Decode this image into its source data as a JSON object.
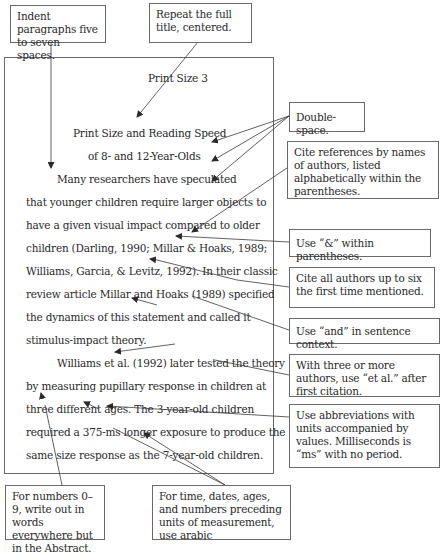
{
  "manuscript": {
    "running_head": "Print Size  3",
    "title_line1": "Print Size and Reading Speed",
    "title_line2": "of 8- and 12-Year-Olds",
    "lines": [
      "Many researchers have speculated",
      "that younger children require larger objects to",
      "have a given visual impact compared to older",
      "children (Darling, 1990;  Millar & Hoaks, 1989;",
      "Williams, Garcia, & Levitz, 1992).  In their classic",
      "review article Millar and Hoaks (1989) specified",
      "the dynamics of this statement and called it",
      "stimulus-impact theory.",
      "Williams et al. (1992) later tested the theory",
      "by measuring pupillary response in children at",
      "three different ages.  The 3-year-old children",
      "required a 375-ms longer exposure to produce the",
      "same size response as the 7-year-old children."
    ]
  },
  "callouts": {
    "indent": "Indent paragraphs five to seven spaces.",
    "repeat_title": "Repeat the full title, centered.",
    "double_space": "Double-space.",
    "cite_references": "Cite references by names of authors, listed alphabetically within the parentheses.",
    "use_ampersand": "Use “&” within parentheses.",
    "cite_all_authors": "Cite all authors up to six the first time mentioned.",
    "use_and": "Use “and” in sentence context.",
    "et_al": "With three or more authors, use “et al.” after first citation.",
    "abbreviations": "Use abbreviations with units accompanied by values. Milliseconds is “ms” with no period.",
    "numbers_words": "For numbers 0–9, write out in words everywhere but in the Abstract.",
    "arabic_numerals": "For time, dates, ages, and numbers preceding units of measurement, use arabic"
  }
}
